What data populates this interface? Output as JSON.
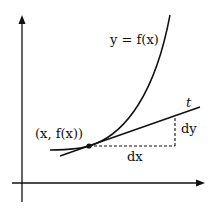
{
  "diagram": {
    "type": "tangent-line-differential",
    "labels": {
      "curve": "y = f(x)",
      "point": "(x, f(x))",
      "tangent": "t",
      "dx": "dx",
      "dy": "dy"
    },
    "colors": {
      "stroke": "#111111",
      "background": "#ffffff"
    }
  }
}
